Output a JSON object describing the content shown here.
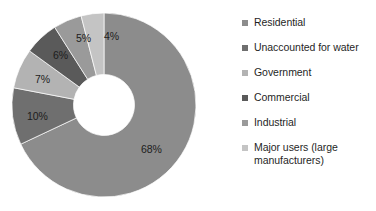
{
  "chart_data": {
    "type": "pie",
    "variant": "donut",
    "title": "",
    "subtitle": "",
    "xlabel": "",
    "ylabel": "",
    "grid": false,
    "legend_position": "right",
    "start_angle_deg": 0,
    "direction": "clockwise",
    "inner_radius_ratio": 0.33,
    "categories": [
      "Residential",
      "Unaccounted for water",
      "Government",
      "Commercial",
      "Industrial",
      "Major users (large manufacturers)"
    ],
    "values": [
      68,
      10,
      7,
      6,
      5,
      4
    ],
    "data_labels": [
      "68%",
      "10%",
      "7%",
      "6%",
      "5%",
      "4%"
    ],
    "colors": [
      "#8c8c8c",
      "#6f6f6f",
      "#b3b3b3",
      "#5a5a5a",
      "#9a9a9a",
      "#c4c4c4"
    ]
  },
  "legend": {
    "items": [
      {
        "label": "Residential",
        "color": "#8c8c8c"
      },
      {
        "label": "Unaccounted for water",
        "color": "#6f6f6f"
      },
      {
        "label": "Government",
        "color": "#b3b3b3"
      },
      {
        "label": "Commercial",
        "color": "#5a5a5a"
      },
      {
        "label": "Industrial",
        "color": "#9a9a9a"
      },
      {
        "label": "Major users (large manufacturers)",
        "color": "#c4c4c4"
      }
    ]
  },
  "slice_labels": [
    {
      "text": "68%",
      "x": 141,
      "y": 144
    },
    {
      "text": "10%",
      "x": 27,
      "y": 111
    },
    {
      "text": "7%",
      "x": 35,
      "y": 74
    },
    {
      "text": "6%",
      "x": 53,
      "y": 50
    },
    {
      "text": "5%",
      "x": 76,
      "y": 33
    },
    {
      "text": "4%",
      "x": 104,
      "y": 31
    }
  ]
}
